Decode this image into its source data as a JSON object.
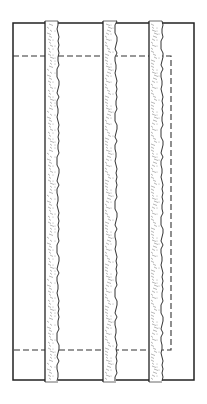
{
  "diagram": {
    "type": "line-drawing",
    "colors": {
      "line": "#222222",
      "strip_texture": "#9a9a9a",
      "background": "#ffffff"
    },
    "outer_rect": {
      "x": 13,
      "y": 23,
      "w": 181,
      "h": 357
    },
    "dashed_rect": {
      "x": 13,
      "y": 56,
      "w": 158,
      "h": 294
    },
    "strips": [
      {
        "id": "strip-left",
        "x": 45,
        "w": 13
      },
      {
        "id": "strip-middle",
        "x": 103,
        "w": 13
      },
      {
        "id": "strip-right",
        "x": 149,
        "w": 13
      }
    ],
    "strip_top": 21,
    "strip_bottom": 382
  }
}
